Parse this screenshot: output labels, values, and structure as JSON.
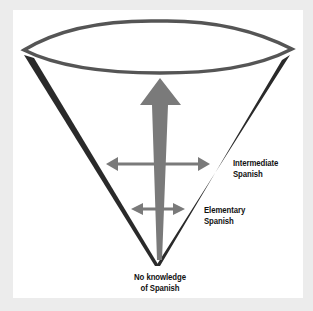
{
  "diagram": {
    "type": "inverted-cone",
    "colors": {
      "background": "#ececec",
      "panel": "#ffffff",
      "cone_outline": "#2a2a2a",
      "rim": "#555555",
      "arrows": "#7a7a7a"
    },
    "labels": {
      "intermediate": {
        "line1": "Intermediate",
        "line2": "Spanish"
      },
      "elementary": {
        "line1": "Elementary",
        "line2": "Spanish"
      },
      "none": {
        "line1": "No knowledge",
        "line2": "of Spanish"
      }
    }
  }
}
